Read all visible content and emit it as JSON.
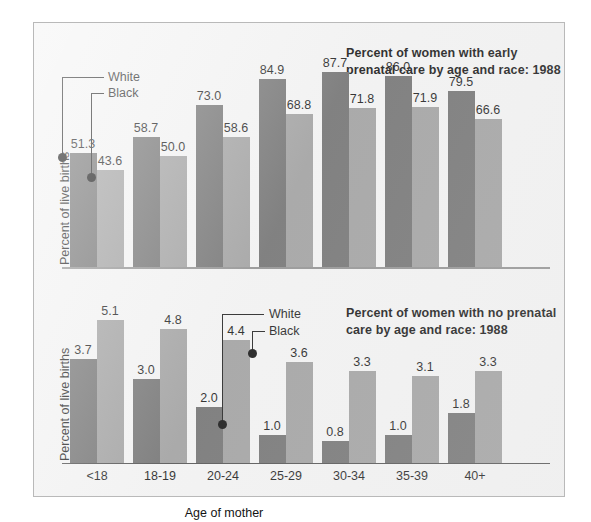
{
  "figure": {
    "background_color": "#ffffff",
    "panel_color": "#f2f2f2",
    "border_color": "#b9b9b9"
  },
  "series_colors": {
    "white": "#6d6d6d",
    "black": "#9d9d9d"
  },
  "legend": {
    "white_label": "White",
    "black_label": "Black"
  },
  "axis": {
    "ylabel": "Percent of live births",
    "xlabel": "Age of mother",
    "categories": [
      "<18",
      "18-19",
      "20-24",
      "25-29",
      "30-34",
      "35-39",
      "40+"
    ]
  },
  "chart_data": [
    {
      "id": "early-prenatal-care",
      "type": "bar",
      "title": "Percent of women with early\nprenatal care by age and race: 1988",
      "xlabel": "Age of mother",
      "ylabel": "Percent of live births",
      "ylim": [
        0,
        100
      ],
      "grid": false,
      "legend_position": "inside-left",
      "categories": [
        "<18",
        "18-19",
        "20-24",
        "25-29",
        "30-34",
        "35-39",
        "40+"
      ],
      "series": [
        {
          "name": "White",
          "color": "#6d6d6d",
          "values": [
            51.3,
            58.7,
            73.0,
            84.9,
            87.7,
            86.0,
            79.5
          ],
          "labels": [
            "51.3",
            "58.7",
            "73.0",
            "84.9",
            "87.7",
            "86.0",
            "79.5"
          ]
        },
        {
          "name": "Black",
          "color": "#9d9d9d",
          "values": [
            43.6,
            50.0,
            58.6,
            68.8,
            71.8,
            71.9,
            66.6
          ],
          "labels": [
            "43.6",
            "50.0",
            "58.6",
            "68.8",
            "71.8",
            "71.9",
            "66.6"
          ]
        }
      ]
    },
    {
      "id": "no-prenatal-care",
      "type": "bar",
      "title": "Percent of women with no prenatal\ncare by age and race: 1988",
      "xlabel": "Age of mother",
      "ylabel": "Percent of live births",
      "ylim": [
        0,
        6
      ],
      "grid": false,
      "legend_position": "inside-center",
      "categories": [
        "<18",
        "18-19",
        "20-24",
        "25-29",
        "30-34",
        "35-39",
        "40+"
      ],
      "series": [
        {
          "name": "White",
          "color": "#6d6d6d",
          "values": [
            3.7,
            3.0,
            2.0,
            1.0,
            0.8,
            1.0,
            1.8
          ],
          "labels": [
            "3.7",
            "3.0",
            "2.0",
            "1.0",
            "0.8",
            "1.0",
            "1.8"
          ]
        },
        {
          "name": "Black",
          "color": "#9d9d9d",
          "values": [
            5.1,
            4.8,
            4.4,
            3.6,
            3.3,
            3.1,
            3.3
          ],
          "labels": [
            "5.1",
            "4.8",
            "4.4",
            "3.6",
            "3.3",
            "3.1",
            "3.3"
          ]
        }
      ]
    }
  ]
}
